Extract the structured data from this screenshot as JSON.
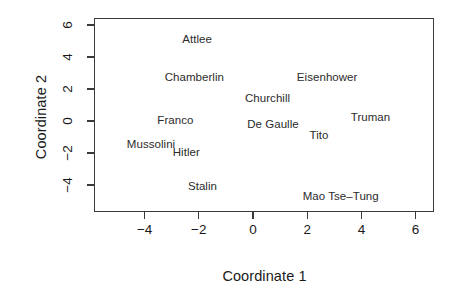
{
  "chart_data": {
    "type": "scatter",
    "title": "",
    "xlabel": "Coordinate 1",
    "ylabel": "Coordinate 2",
    "xlim": [
      -5.6,
      6.9
    ],
    "ylim": [
      -5.1,
      6.6
    ],
    "xticks": [
      -4,
      -2,
      0,
      2,
      4,
      6
    ],
    "xticklabels": [
      "−4",
      "−2",
      "0",
      "2",
      "4",
      "6"
    ],
    "yticks": [
      -4,
      -2,
      0,
      2,
      4,
      6
    ],
    "yticklabels": [
      "−4",
      "−2",
      "0",
      "2",
      "4",
      "6"
    ],
    "grid": false,
    "legend": null,
    "markers": "text-only",
    "points": [
      {
        "label": "Attlee",
        "x": -2.1,
        "y": 5.2
      },
      {
        "label": "Chamberlin",
        "x": -2.2,
        "y": 2.8
      },
      {
        "label": "Eisenhower",
        "x": 2.7,
        "y": 2.8
      },
      {
        "label": "Churchill",
        "x": 0.5,
        "y": 1.5
      },
      {
        "label": "Truman",
        "x": 4.3,
        "y": 0.3
      },
      {
        "label": "Franco",
        "x": -2.9,
        "y": 0.1
      },
      {
        "label": "De Gaulle",
        "x": 0.7,
        "y": -0.1
      },
      {
        "label": "Tito",
        "x": 2.4,
        "y": -0.8
      },
      {
        "label": "Mussolini",
        "x": -3.8,
        "y": -1.4
      },
      {
        "label": "Hitler",
        "x": -2.5,
        "y": -1.9
      },
      {
        "label": "Stalin",
        "x": -1.9,
        "y": -4.0
      },
      {
        "label": "Mao Tse–Tung",
        "x": 3.2,
        "y": -4.6
      }
    ]
  },
  "axes": {
    "x_title": "Coordinate 1",
    "y_title": "Coordinate 2"
  }
}
